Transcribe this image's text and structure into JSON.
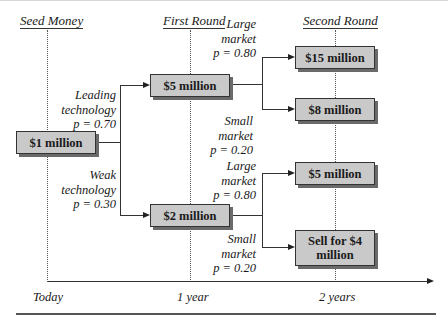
{
  "headings": {
    "seed": "Seed Money",
    "first": "First Round",
    "second": "Second Round"
  },
  "nodes": {
    "root": "$1 million",
    "first_high": "$5 million",
    "first_low": "$2 million",
    "second_hh": "$15 million",
    "second_hl": "$8 million",
    "second_lh": "$5 million",
    "second_ll": "Sell for $4 million"
  },
  "branches": {
    "leading": [
      "Leading",
      "technology",
      "p = 0.70"
    ],
    "weak": [
      "Weak",
      "technology",
      "p = 0.30"
    ],
    "large_top": [
      "Large",
      "market",
      "p = 0.80"
    ],
    "small_top": [
      "Small",
      "market",
      "p = 0.20"
    ],
    "large_bottom": [
      "Large",
      "market",
      "p = 0.80"
    ],
    "small_bottom": [
      "Small",
      "market",
      "p = 0.20"
    ]
  },
  "timeline": {
    "t0": "Today",
    "t1": "1 year",
    "t2": "2 years"
  },
  "colors": {
    "box_fill": "#c9c9c9",
    "box_shadow": "#6a6a6a",
    "line": "#333333"
  }
}
